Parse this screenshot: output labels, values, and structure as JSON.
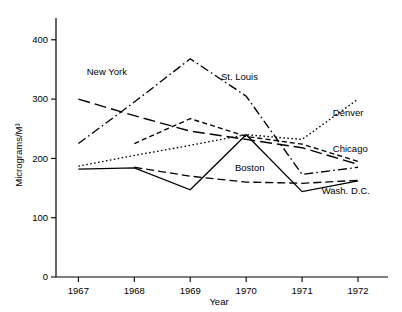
{
  "chart_data": {
    "type": "line",
    "title": "",
    "xlabel": "Year",
    "ylabel": "Micrograms/M³",
    "x": [
      1967,
      1968,
      1969,
      1970,
      1971,
      1972
    ],
    "xtick_labels": [
      "1967",
      "1968",
      "1969",
      "1970",
      "1971",
      "1972"
    ],
    "ytick_labels": [
      "0",
      "100",
      "200",
      "300",
      "400"
    ],
    "yticks": [
      0,
      100,
      200,
      300,
      400
    ],
    "ylim": [
      0,
      430
    ],
    "xlim": [
      1966.6,
      1972.5
    ],
    "grid": false,
    "legend_position": "inline-annotations",
    "series": [
      {
        "name": "New York",
        "label": "New York",
        "dash": "long-dash",
        "x": [
          1967,
          1968,
          1969,
          1970,
          1971,
          1972
        ],
        "values": [
          300,
          272,
          246,
          232,
          218,
          190
        ]
      },
      {
        "name": "St. Louis",
        "label": "St. Louis",
        "dash": "dash-dot",
        "x": [
          1967,
          1968,
          1969,
          1970,
          1971,
          1972
        ],
        "values": [
          225,
          295,
          368,
          305,
          173,
          185
        ]
      },
      {
        "name": "Denver",
        "label": "Denver",
        "dash": "dotted",
        "x": [
          1967,
          1968,
          1969,
          1970,
          1971,
          1972
        ],
        "values": [
          187,
          205,
          222,
          240,
          232,
          300
        ]
      },
      {
        "name": "Chicago",
        "label": "Chicago",
        "dash": "short-dash",
        "x": [
          1968,
          1969,
          1970,
          1971,
          1972
        ],
        "values": [
          225,
          267,
          237,
          224,
          195
        ]
      },
      {
        "name": "Boston",
        "label": "Boston",
        "dash": "medium-dash",
        "x": [
          1968,
          1969,
          1970,
          1971,
          1972
        ],
        "values": [
          185,
          170,
          160,
          158,
          163
        ]
      },
      {
        "name": "Wash. D.C.",
        "label": "Wash. D.C.",
        "dash": "solid",
        "x": [
          1967,
          1968,
          1969,
          1970,
          1971,
          1972
        ],
        "values": [
          182,
          184,
          147,
          240,
          144,
          162
        ]
      }
    ],
    "annotations": [
      {
        "text": "New York",
        "x": 1967.15,
        "y": 341
      },
      {
        "text": "St. Louis",
        "x": 1969.55,
        "y": 333
      },
      {
        "text": "Denver",
        "x": 1971.55,
        "y": 272
      },
      {
        "text": "Chicago",
        "x": 1971.55,
        "y": 211
      },
      {
        "text": "Boston",
        "x": 1969.8,
        "y": 178
      },
      {
        "text": "Wash. D.C.",
        "x": 1971.35,
        "y": 140
      }
    ]
  }
}
